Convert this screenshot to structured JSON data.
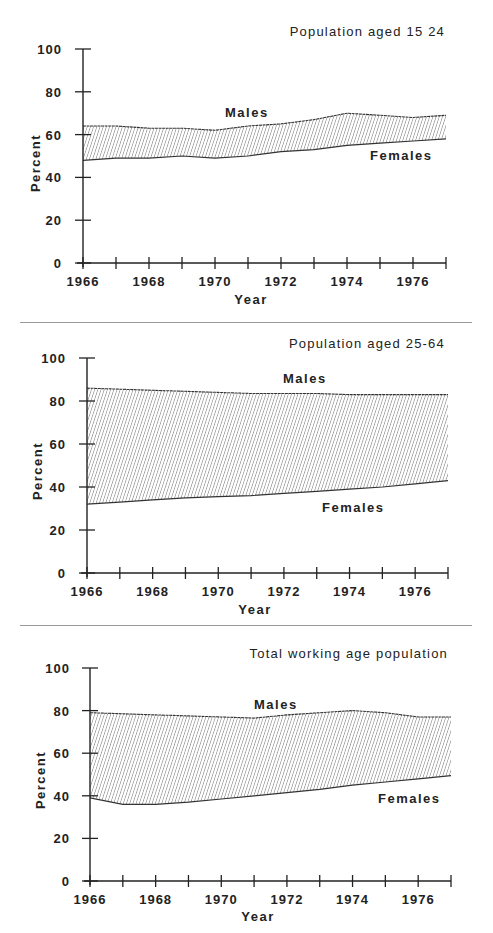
{
  "chart_data": [
    {
      "type": "area",
      "title": "Population aged 15 24",
      "xlabel": "Year",
      "ylabel": "Percent",
      "ylim": [
        0,
        100
      ],
      "xlim": [
        1966,
        1977
      ],
      "yticks": [
        0,
        20,
        40,
        60,
        80,
        100
      ],
      "xtick_labels": [
        "1966",
        "1968",
        "1970",
        "1972",
        "1974",
        "1976"
      ],
      "grid": false,
      "fill": "hatched band between series",
      "x": [
        1966,
        1967,
        1968,
        1969,
        1970,
        1971,
        1972,
        1973,
        1974,
        1975,
        1976,
        1977
      ],
      "series": [
        {
          "name": "Males",
          "values": [
            64,
            64,
            63,
            63,
            62,
            64,
            65,
            67,
            70,
            69,
            68,
            69
          ]
        },
        {
          "name": "Females",
          "values": [
            48,
            49,
            49,
            50,
            49,
            50,
            52,
            53,
            55,
            56,
            57,
            58
          ]
        }
      ]
    },
    {
      "type": "area",
      "title": "Population aged 25-64",
      "xlabel": "Year",
      "ylabel": "Percent",
      "ylim": [
        0,
        100
      ],
      "xlim": [
        1966,
        1977
      ],
      "yticks": [
        0,
        20,
        40,
        60,
        80,
        100
      ],
      "xtick_labels": [
        "1966",
        "1968",
        "1970",
        "1972",
        "1974",
        "1976"
      ],
      "grid": false,
      "fill": "hatched band between series",
      "x": [
        1966,
        1967,
        1968,
        1969,
        1970,
        1971,
        1972,
        1973,
        1974,
        1975,
        1976,
        1977
      ],
      "series": [
        {
          "name": "Males",
          "values": [
            86,
            85.5,
            85,
            84.5,
            84,
            83.5,
            83.5,
            83.5,
            83,
            83,
            83,
            83
          ]
        },
        {
          "name": "Females",
          "values": [
            32,
            33,
            34,
            35,
            35.5,
            36,
            37,
            38,
            39,
            40,
            41.5,
            43
          ]
        }
      ]
    },
    {
      "type": "area",
      "title": "Total working age population",
      "xlabel": "Year",
      "ylabel": "Percent",
      "ylim": [
        0,
        100
      ],
      "xlim": [
        1966,
        1977
      ],
      "yticks": [
        0,
        20,
        40,
        60,
        80,
        100
      ],
      "xtick_labels": [
        "1966",
        "1968",
        "1970",
        "1972",
        "1974",
        "1976"
      ],
      "grid": false,
      "fill": "hatched band between series",
      "x": [
        1966,
        1967,
        1968,
        1969,
        1970,
        1971,
        1972,
        1973,
        1974,
        1975,
        1976,
        1977
      ],
      "series": [
        {
          "name": "Males",
          "values": [
            79,
            78.5,
            78,
            77.5,
            77,
            76.5,
            78,
            79,
            80,
            79,
            77,
            77
          ]
        },
        {
          "name": "Females",
          "values": [
            39,
            36,
            36,
            37,
            38.5,
            40,
            41.5,
            43,
            45,
            46.5,
            48,
            49.5
          ]
        }
      ]
    }
  ],
  "panels": [
    {
      "title": "Population aged 15 24",
      "males_label": "Males",
      "females_label": "Females",
      "xlabel": "Year",
      "ylabel": "Percent"
    },
    {
      "title": "Population aged 25-64",
      "males_label": "Males",
      "females_label": "Females",
      "xlabel": "Year",
      "ylabel": "Percent"
    },
    {
      "title": "Total working age population",
      "males_label": "Males",
      "females_label": "Females",
      "xlabel": "Year",
      "ylabel": "Percent"
    }
  ],
  "axis": {
    "y_ticks": [
      "0",
      "20",
      "40",
      "60",
      "80",
      "100"
    ],
    "x_ticks": [
      "1966",
      "1968",
      "1970",
      "1972",
      "1974",
      "1976"
    ]
  },
  "colors": {
    "ink": "#222222",
    "hatch": "#555555",
    "divider": "#9a9a9a",
    "background": "#ffffff"
  }
}
